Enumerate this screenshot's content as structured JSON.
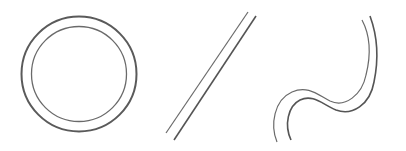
{
  "figure": {
    "description": "Three double-stroked line shapes",
    "stroke_color": "#555555",
    "background": "#ffffff",
    "shapes": [
      {
        "name": "double-circle",
        "type": "circle",
        "center": [
          79,
          74
        ],
        "outer_radius": 58,
        "inner_radius": 48
      },
      {
        "name": "double-diagonal-line",
        "type": "line-pair",
        "line_a": [
          [
            248,
            12
          ],
          [
            166,
            133
          ]
        ],
        "line_b": [
          [
            256,
            16
          ],
          [
            174,
            140
          ]
        ]
      },
      {
        "name": "double-s-curve",
        "type": "curve-pair"
      }
    ]
  }
}
